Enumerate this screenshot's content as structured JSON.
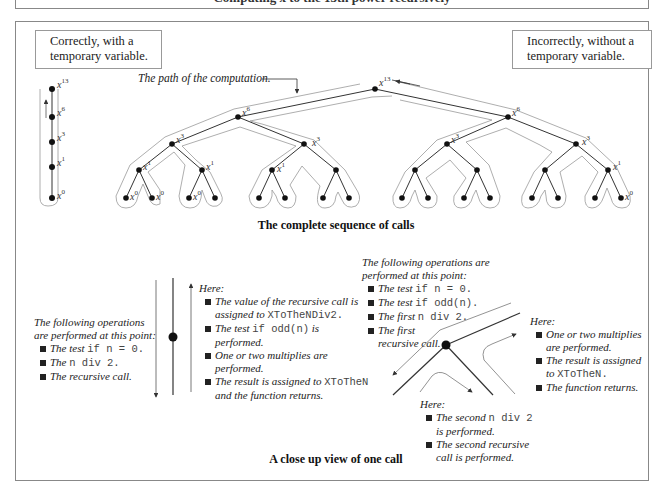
{
  "top_strip": {
    "text": "Computing x to the 13th power recursively"
  },
  "labels": {
    "correct": [
      "Correctly, with a",
      "temporary variable."
    ],
    "incorrect": [
      "Incorrectly, without a",
      "temporary variable."
    ],
    "path_annotation": "The path of the computation."
  },
  "captions": {
    "upper": "The complete sequence of calls",
    "lower": "A close up view of one call"
  },
  "chain": {
    "nodes": [
      {
        "base": "x",
        "exp": "13"
      },
      {
        "base": "x",
        "exp": "6"
      },
      {
        "base": "x",
        "exp": "3"
      },
      {
        "base": "x",
        "exp": "1"
      },
      {
        "base": "x",
        "exp": "0"
      }
    ]
  },
  "tree": {
    "root": {
      "base": "x",
      "exp": "13"
    },
    "level1": [
      {
        "base": "x",
        "exp": "6"
      },
      {
        "base": "x",
        "exp": "6"
      }
    ],
    "level2": [
      {
        "base": "x",
        "exp": "3"
      },
      {
        "base": "x",
        "exp": "3"
      },
      {
        "base": "x",
        "exp": "3"
      },
      {
        "base": "x",
        "exp": "3"
      }
    ],
    "level3_labels": [
      {
        "base": "x",
        "exp": "1"
      },
      {
        "base": "x",
        "exp": "1"
      },
      {
        "base": "x",
        "exp": "1"
      },
      {
        "base": "x",
        "exp": "1"
      }
    ],
    "leaf_labels": [
      {
        "base": "x",
        "exp": "0"
      },
      {
        "base": "x",
        "exp": "0"
      },
      {
        "base": "x",
        "exp": "0"
      },
      {
        "base": "x",
        "exp": "0"
      }
    ]
  },
  "notes": {
    "left_before": {
      "intro": [
        "The following operations",
        "are performed at this point:"
      ],
      "items": [
        {
          "text": "The test ",
          "code": "if n = 0."
        },
        {
          "text": "The ",
          "code": "n div 2."
        },
        {
          "text": "The recursive call.",
          "code": ""
        }
      ]
    },
    "left_after": {
      "intro": "Here:",
      "items": [
        {
          "text": "The value of the recursive call is assigned to ",
          "code": "XToTheNDiv2.",
          "tail": ""
        },
        {
          "text": "The test ",
          "code": "if odd(n)",
          "tail": " is performed."
        },
        {
          "text": "One or two multiplies are performed.",
          "code": "",
          "tail": ""
        },
        {
          "text": "The result is assigned to ",
          "code": "XToTheN",
          "tail": " and the function returns."
        }
      ]
    },
    "right_before": {
      "intro": [
        "The following operations are",
        "performed at this point:"
      ],
      "items": [
        {
          "text": "The test ",
          "code": "if n = 0."
        },
        {
          "text": "The test ",
          "code": "if odd(n)."
        },
        {
          "text": "The first ",
          "code": "n div 2."
        },
        {
          "text": "The first recursive call.",
          "code": ""
        }
      ]
    },
    "right_after": {
      "intro": "Here:",
      "items": [
        {
          "text": "One or two multiplies are performed.",
          "code": "",
          "tail": ""
        },
        {
          "text": "The result is assigned to ",
          "code": "XToTheN.",
          "tail": ""
        },
        {
          "text": "The function returns.",
          "code": "",
          "tail": ""
        }
      ]
    },
    "right_middle": {
      "intro": "Here:",
      "items": [
        {
          "text": "The second ",
          "code": "n div 2",
          "tail": " is performed."
        },
        {
          "text": "The second recursive call is performed.",
          "code": "",
          "tail": ""
        }
      ]
    }
  }
}
